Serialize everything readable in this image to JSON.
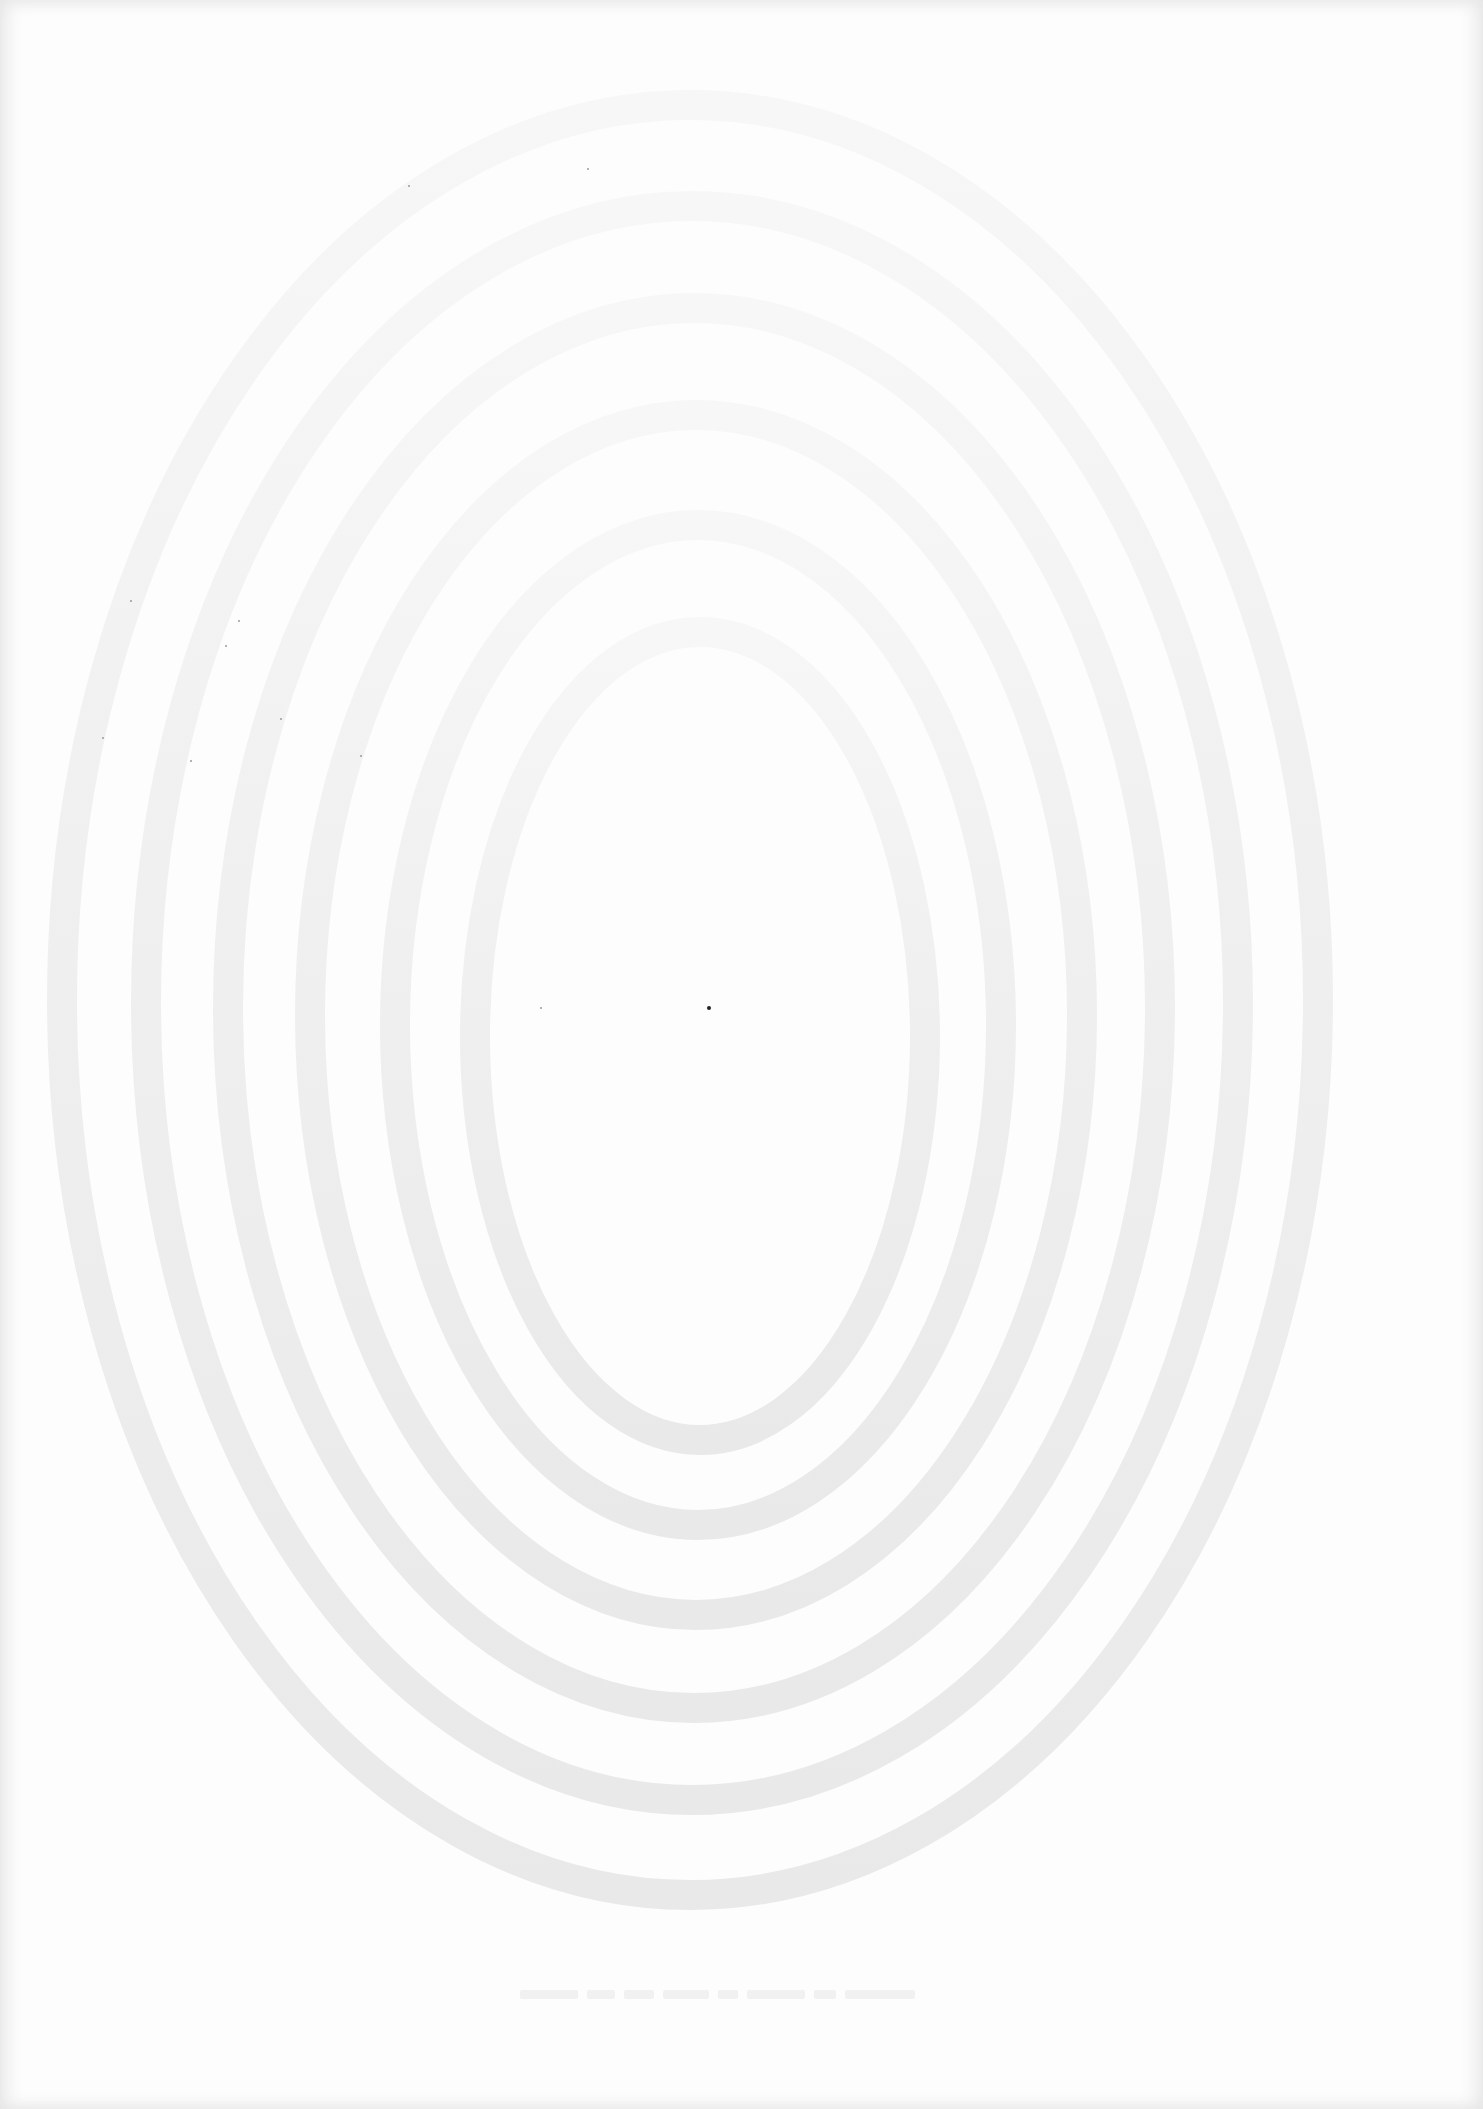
{
  "page": {
    "type": "scanned-blank-page",
    "background_color": "#fdfdfd",
    "ring_color": "#ececec",
    "center_dot_color": "#222222"
  },
  "watermark": {
    "shape": "concentric-ovals",
    "ring_count": 6,
    "rings": [
      {
        "cx": 700,
        "cy": 1036,
        "rx": 225,
        "ry": 404
      },
      {
        "cx": 698,
        "cy": 1025,
        "rx": 303,
        "ry": 500
      },
      {
        "cx": 696,
        "cy": 1015,
        "rx": 386,
        "ry": 600
      },
      {
        "cx": 694,
        "cy": 1008,
        "rx": 466,
        "ry": 700
      },
      {
        "cx": 692,
        "cy": 1003,
        "rx": 546,
        "ry": 797
      },
      {
        "cx": 690,
        "cy": 1000,
        "rx": 628,
        "ry": 895
      }
    ]
  },
  "footer_bleed_text": {
    "legible": false,
    "word_widths": [
      58,
      28,
      30,
      46,
      20,
      58,
      22,
      70
    ]
  }
}
